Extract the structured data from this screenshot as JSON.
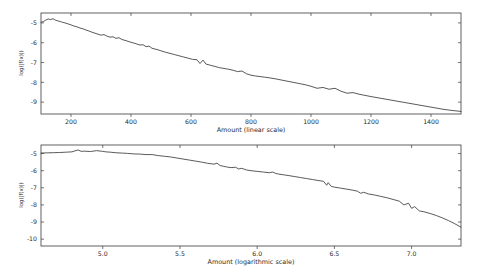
{
  "figure": {
    "background": "#ffffff",
    "line_color": "#3c3c3c",
    "axis_color": "#3b3b3b",
    "panel_count": 2
  },
  "chart_data": [
    {
      "type": "line",
      "id": "linear-scale-panel",
      "title": "",
      "xlabel": "Amount (linear scale)",
      "ylabel": "log(|f(x)|)",
      "xlim": [
        100,
        1500
      ],
      "ylim": [
        -9.6,
        -4.5
      ],
      "xticks": [
        200,
        400,
        600,
        800,
        1000,
        1200,
        1400
      ],
      "xticklabels": [
        "200",
        "400",
        "600",
        "800",
        "1000",
        "1200",
        "1400"
      ],
      "yticks": [
        -5,
        -6,
        -7,
        -8,
        -9
      ],
      "yticklabels": [
        "-5",
        "-6",
        "-7",
        "-8",
        "-9"
      ],
      "grid": false,
      "legend": null,
      "series": [
        {
          "name": "log|f(x)| vs amount",
          "x": [
            100,
            108,
            116,
            124,
            132,
            140,
            148,
            156,
            164,
            172,
            180,
            190,
            200,
            210,
            220,
            230,
            240,
            250,
            260,
            270,
            280,
            290,
            300,
            310,
            320,
            330,
            340,
            350,
            360,
            370,
            380,
            390,
            400,
            410,
            420,
            430,
            440,
            450,
            460,
            470,
            480,
            490,
            500,
            515,
            530,
            545,
            560,
            575,
            590,
            605,
            620,
            630,
            640,
            650,
            665,
            680,
            695,
            710,
            725,
            740,
            755,
            770,
            785,
            800,
            815,
            830,
            845,
            860,
            880,
            900,
            920,
            940,
            960,
            980,
            1000,
            1020,
            1040,
            1060,
            1080,
            1100,
            1120,
            1140,
            1160,
            1180,
            1200,
            1230,
            1260,
            1290,
            1320,
            1350,
            1380,
            1410,
            1440,
            1470,
            1500
          ],
          "y": [
            -4.97,
            -4.93,
            -4.86,
            -4.8,
            -4.83,
            -4.79,
            -4.86,
            -4.9,
            -4.93,
            -4.97,
            -5.0,
            -5.05,
            -5.1,
            -5.16,
            -5.2,
            -5.26,
            -5.3,
            -5.36,
            -5.41,
            -5.47,
            -5.52,
            -5.57,
            -5.62,
            -5.59,
            -5.67,
            -5.72,
            -5.7,
            -5.78,
            -5.75,
            -5.84,
            -5.88,
            -5.93,
            -5.98,
            -6.02,
            -6.07,
            -6.12,
            -6.1,
            -6.2,
            -6.17,
            -6.28,
            -6.32,
            -6.36,
            -6.41,
            -6.48,
            -6.54,
            -6.6,
            -6.66,
            -6.72,
            -6.78,
            -6.84,
            -6.86,
            -7.05,
            -6.88,
            -7.08,
            -7.14,
            -7.2,
            -7.26,
            -7.3,
            -7.34,
            -7.39,
            -7.46,
            -7.43,
            -7.57,
            -7.64,
            -7.68,
            -7.71,
            -7.74,
            -7.77,
            -7.82,
            -7.88,
            -7.94,
            -8.0,
            -8.06,
            -8.12,
            -8.2,
            -8.3,
            -8.26,
            -8.35,
            -8.3,
            -8.45,
            -8.55,
            -8.52,
            -8.6,
            -8.66,
            -8.72,
            -8.8,
            -8.88,
            -8.96,
            -9.04,
            -9.12,
            -9.2,
            -9.28,
            -9.36,
            -9.42,
            -9.47
          ]
        }
      ]
    },
    {
      "type": "line",
      "id": "logarithmic-scale-panel",
      "title": "",
      "xlabel": "Amount (logarithmic scale)",
      "ylabel": "log(|f(x)|)",
      "xlim": [
        4.6,
        7.32
      ],
      "ylim": [
        -10.4,
        -4.5
      ],
      "xticks": [
        5.0,
        5.5,
        6.0,
        6.5,
        7.0
      ],
      "xticklabels": [
        "5.0",
        "5.5",
        "6.0",
        "6.5",
        "7.0"
      ],
      "yticks": [
        -5,
        -6,
        -7,
        -8,
        -9,
        -10
      ],
      "yticklabels": [
        "-5",
        "-6",
        "-7",
        "-8",
        "-9",
        "-10"
      ],
      "grid": false,
      "legend": null,
      "series": [
        {
          "name": "log|f(x)| vs log(amount)",
          "x": [
            4.6,
            4.64,
            4.68,
            4.72,
            4.76,
            4.8,
            4.84,
            4.86,
            4.88,
            4.92,
            4.96,
            5.0,
            5.02,
            5.05,
            5.08,
            5.12,
            5.16,
            5.2,
            5.24,
            5.28,
            5.32,
            5.36,
            5.4,
            5.44,
            5.48,
            5.52,
            5.56,
            5.6,
            5.64,
            5.68,
            5.72,
            5.74,
            5.76,
            5.78,
            5.8,
            5.83,
            5.86,
            5.88,
            5.9,
            5.93,
            5.96,
            6.0,
            6.04,
            6.08,
            6.1,
            6.12,
            6.14,
            6.17,
            6.2,
            6.24,
            6.28,
            6.32,
            6.36,
            6.4,
            6.43,
            6.45,
            6.46,
            6.48,
            6.5,
            6.54,
            6.58,
            6.62,
            6.65,
            6.67,
            6.69,
            6.72,
            6.76,
            6.8,
            6.84,
            6.88,
            6.92,
            6.95,
            6.98,
            7.0,
            7.02,
            7.05,
            7.08,
            7.12,
            7.16,
            7.2,
            7.24,
            7.28,
            7.32
          ],
          "y": [
            -4.97,
            -4.96,
            -4.95,
            -4.94,
            -4.92,
            -4.9,
            -4.79,
            -4.87,
            -4.86,
            -4.88,
            -4.83,
            -4.87,
            -4.9,
            -4.92,
            -4.95,
            -4.97,
            -4.99,
            -5.02,
            -5.03,
            -5.06,
            -5.06,
            -5.12,
            -5.16,
            -5.2,
            -5.26,
            -5.32,
            -5.38,
            -5.44,
            -5.5,
            -5.57,
            -5.62,
            -5.56,
            -5.7,
            -5.74,
            -5.78,
            -5.82,
            -5.8,
            -5.9,
            -5.86,
            -5.96,
            -6.0,
            -6.04,
            -6.08,
            -6.12,
            -6.08,
            -6.16,
            -6.2,
            -6.24,
            -6.28,
            -6.34,
            -6.4,
            -6.46,
            -6.52,
            -6.58,
            -6.62,
            -6.85,
            -6.7,
            -6.92,
            -6.96,
            -7.02,
            -7.08,
            -7.14,
            -7.2,
            -7.32,
            -7.26,
            -7.36,
            -7.42,
            -7.5,
            -7.58,
            -7.68,
            -7.78,
            -8.0,
            -7.9,
            -8.2,
            -8.1,
            -8.35,
            -8.4,
            -8.5,
            -8.62,
            -8.76,
            -8.92,
            -9.1,
            -9.3
          ]
        }
      ]
    }
  ]
}
